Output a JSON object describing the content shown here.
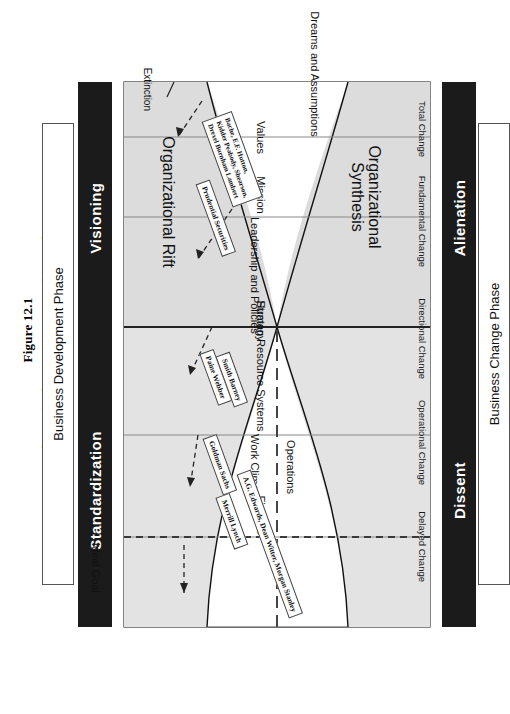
{
  "figure": {
    "number": "Figure 12.1",
    "title": "Change in the American Securities Industry: Wall Street"
  },
  "top_header": {
    "caption": "Business Change Phase",
    "phases": [
      "Dissent",
      "Alienation"
    ]
  },
  "bottom_header": {
    "caption": "Business Development Phase",
    "phases": [
      "Standardization",
      "Visioning"
    ]
  },
  "change_stages": [
    "Delayed Change",
    "Operational Change",
    "Directional Change",
    "Fundamental Change",
    "Total Change"
  ],
  "extinction_label": "Extinction",
  "ideal_goal_label": "Ideal Goal",
  "organization_levels": [
    "Finance",
    "Work Climate",
    "Operations",
    "Human Resource Systems",
    "Strategy",
    "Leadership and Policies",
    "Mission",
    "Values",
    "Dreams and Assumptions"
  ],
  "zones": {
    "rift": "Organizational Rift",
    "synthesis": "Organizational Synthesis"
  },
  "callouts": [
    {
      "id": "ag-edwards",
      "text": "A.G. Edwards, Dean Witter, Morgan Stanley"
    },
    {
      "id": "merrill-lynch",
      "text": "Merrill Lynch"
    },
    {
      "id": "goldman-sachs",
      "text": "Goldman Sachs"
    },
    {
      "id": "paine-webber",
      "text": "Paine Webber"
    },
    {
      "id": "smith-barney",
      "text": "Smith Barney"
    },
    {
      "id": "prudential",
      "text": "Prudential Securities"
    },
    {
      "id": "bache",
      "text": "Bache, E.F. Hutton,\nKidder Peabody, Shearson,\nDrexel Burnham Lambert"
    }
  ],
  "colors": {
    "phase_bar": "#1b1b1b",
    "plate_fill": "#e3e3e3",
    "zone_fill": "#dcdcdc",
    "line": "#111111"
  }
}
